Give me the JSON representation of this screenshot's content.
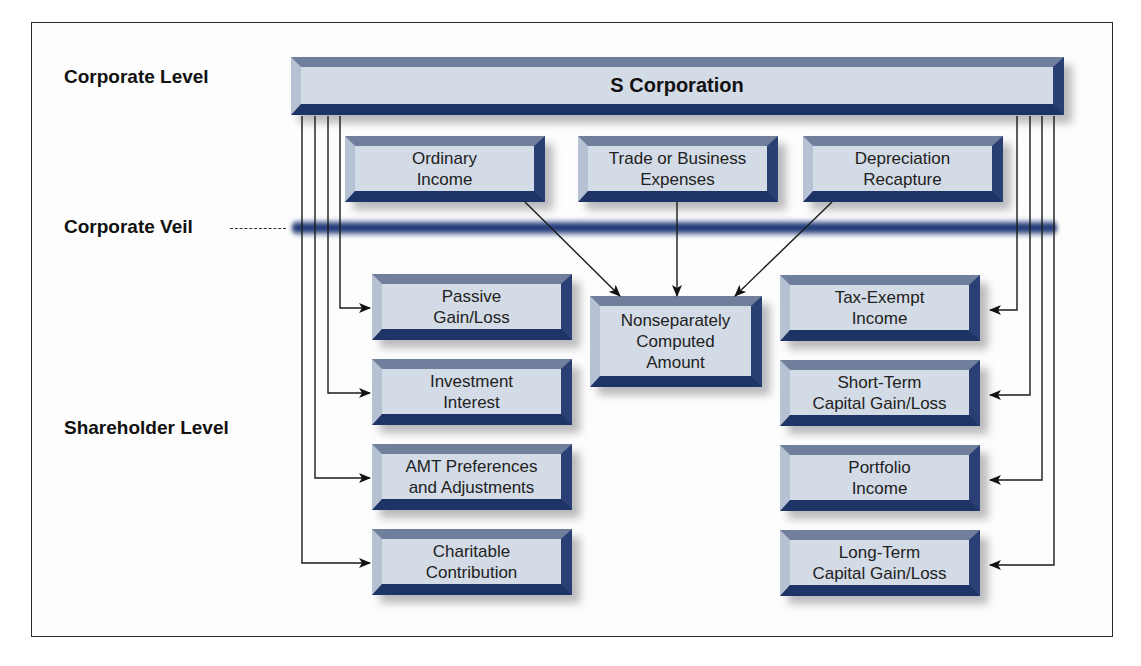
{
  "levels": {
    "corporate_level": "Corporate Level",
    "corporate_veil": "Corporate Veil",
    "shareholder_level": "Shareholder Level"
  },
  "top_box": {
    "label": "S Corporation"
  },
  "corporate_items": [
    {
      "line1": "Ordinary",
      "line2": "Income"
    },
    {
      "line1": "Trade or Business",
      "line2": "Expenses"
    },
    {
      "line1": "Depreciation",
      "line2": "Recapture"
    }
  ],
  "center_box": {
    "line1": "Nonseparately",
    "line2": "Computed",
    "line3": "Amount"
  },
  "left_items": [
    {
      "line1": "Passive",
      "line2": "Gain/Loss"
    },
    {
      "line1": "Investment",
      "line2": "Interest"
    },
    {
      "line1": "AMT Preferences",
      "line2": "and Adjustments"
    },
    {
      "line1": "Charitable",
      "line2": "Contribution"
    }
  ],
  "right_items": [
    {
      "line1": "Tax-Exempt",
      "line2": "Income"
    },
    {
      "line1": "Short-Term",
      "line2": "Capital Gain/Loss"
    },
    {
      "line1": "Portfolio",
      "line2": "Income"
    },
    {
      "line1": "Long-Term",
      "line2": "Capital Gain/Loss"
    }
  ],
  "colors": {
    "box_face": "#d3dbe6",
    "box_dark_edge": "#1f3466",
    "box_top_edge": "#6f7f9c",
    "veil": "#1f3a7a",
    "text": "#222222"
  }
}
